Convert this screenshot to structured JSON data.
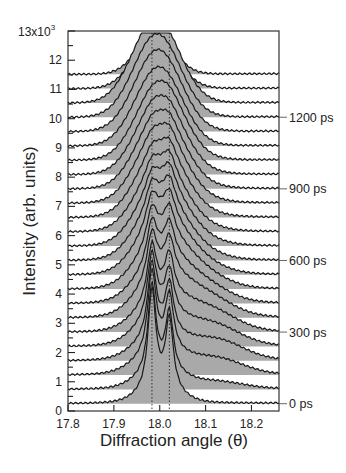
{
  "chart_data": {
    "type": "line",
    "subtype": "waterfall-stacked-diffraction-profiles",
    "title": "",
    "xlabel": "Diffraction angle (θ)",
    "ylabel": "Intensity (arb. units)",
    "xlim": [
      17.8,
      18.26
    ],
    "ylim": [
      0,
      13
    ],
    "y_scale_label": "13x10",
    "y_scale_exponent": "3",
    "x_ticks": [
      "17.8",
      "17.9",
      "18.0",
      "18.1",
      "18.2"
    ],
    "x_tick_values": [
      17.8,
      17.9,
      18.0,
      18.1,
      18.2
    ],
    "y_ticks": [
      "0",
      "1",
      "2",
      "3",
      "4",
      "5",
      "6",
      "7",
      "8",
      "9",
      "10",
      "11",
      "12"
    ],
    "y_tick_values": [
      0,
      1,
      2,
      3,
      4,
      5,
      6,
      7,
      8,
      9,
      10,
      11,
      12
    ],
    "grid": false,
    "reference_lines": [
      {
        "x": 17.983,
        "style": "dotted"
      },
      {
        "x": 18.021,
        "style": "dotted"
      }
    ],
    "fill_color": "#a9a9a9",
    "line_color": "#1a1a1a",
    "time_labels": [
      {
        "label": "0 ps",
        "curve_index": 0
      },
      {
        "label": "300 ps",
        "curve_index": 5
      },
      {
        "label": "600 ps",
        "curve_index": 10
      },
      {
        "label": "900 ps",
        "curve_index": 15
      },
      {
        "label": "1200 ps",
        "curve_index": 20
      }
    ],
    "time_step_ps": 60,
    "curve_count": 22,
    "curve_offset_step": 0.49,
    "first_baseline": 0.25,
    "series_description": "Stacked diffraction profiles from 0 ps (bottom) to ~1260 ps (top), each offset by ~0.49x10^3. Early times show split peaks at 17.983 and 18.021 with a broad shoulder extending toward 18.1–18.2; at later times the profile merges into a single broad peak near 18.00.",
    "series": [
      {
        "time_ps": 0,
        "baseline": 0.25,
        "peak1": {
          "x": 17.983,
          "h": 3.4,
          "w": 0.01
        },
        "peak2": {
          "x": 18.021,
          "h": 2.4,
          "w": 0.01
        },
        "broad": {
          "x": 18.0,
          "h": 0.5,
          "w": 0.04
        },
        "shoulder": {
          "x": 18.12,
          "h": 0.0,
          "w": 0.05
        }
      },
      {
        "time_ps": 60,
        "baseline": 0.74,
        "peak1": {
          "x": 17.983,
          "h": 3.0,
          "w": 0.01
        },
        "peak2": {
          "x": 18.021,
          "h": 2.0,
          "w": 0.01
        },
        "broad": {
          "x": 18.0,
          "h": 0.6,
          "w": 0.045
        },
        "shoulder": {
          "x": 18.12,
          "h": 0.25,
          "w": 0.06
        }
      },
      {
        "time_ps": 120,
        "baseline": 1.23,
        "peak1": {
          "x": 17.983,
          "h": 2.8,
          "w": 0.011
        },
        "peak2": {
          "x": 18.021,
          "h": 1.9,
          "w": 0.011
        },
        "broad": {
          "x": 18.0,
          "h": 0.7,
          "w": 0.05
        },
        "shoulder": {
          "x": 18.12,
          "h": 0.55,
          "w": 0.06
        }
      },
      {
        "time_ps": 180,
        "baseline": 1.72,
        "peak1": {
          "x": 17.983,
          "h": 2.5,
          "w": 0.011
        },
        "peak2": {
          "x": 18.021,
          "h": 1.7,
          "w": 0.011
        },
        "broad": {
          "x": 18.0,
          "h": 0.8,
          "w": 0.05
        },
        "shoulder": {
          "x": 18.12,
          "h": 0.7,
          "w": 0.06
        }
      },
      {
        "time_ps": 240,
        "baseline": 2.21,
        "peak1": {
          "x": 17.983,
          "h": 2.2,
          "w": 0.012
        },
        "peak2": {
          "x": 18.021,
          "h": 1.5,
          "w": 0.012
        },
        "broad": {
          "x": 18.0,
          "h": 0.9,
          "w": 0.05
        },
        "shoulder": {
          "x": 18.11,
          "h": 0.75,
          "w": 0.06
        }
      },
      {
        "time_ps": 300,
        "baseline": 2.7,
        "peak1": {
          "x": 17.983,
          "h": 1.9,
          "w": 0.012
        },
        "peak2": {
          "x": 18.021,
          "h": 1.4,
          "w": 0.012
        },
        "broad": {
          "x": 18.0,
          "h": 1.0,
          "w": 0.05
        },
        "shoulder": {
          "x": 18.1,
          "h": 0.8,
          "w": 0.06
        }
      },
      {
        "time_ps": 360,
        "baseline": 3.19,
        "peak1": {
          "x": 17.983,
          "h": 1.6,
          "w": 0.013
        },
        "peak2": {
          "x": 18.021,
          "h": 1.2,
          "w": 0.013
        },
        "broad": {
          "x": 18.0,
          "h": 1.2,
          "w": 0.05
        },
        "shoulder": {
          "x": 18.09,
          "h": 0.8,
          "w": 0.06
        }
      },
      {
        "time_ps": 420,
        "baseline": 3.68,
        "peak1": {
          "x": 17.983,
          "h": 1.4,
          "w": 0.013
        },
        "peak2": {
          "x": 18.021,
          "h": 1.1,
          "w": 0.013
        },
        "broad": {
          "x": 18.0,
          "h": 1.3,
          "w": 0.05
        },
        "shoulder": {
          "x": 18.08,
          "h": 0.75,
          "w": 0.06
        }
      },
      {
        "time_ps": 480,
        "baseline": 4.17,
        "peak1": {
          "x": 17.983,
          "h": 1.2,
          "w": 0.014
        },
        "peak2": {
          "x": 18.021,
          "h": 1.0,
          "w": 0.014
        },
        "broad": {
          "x": 18.0,
          "h": 1.4,
          "w": 0.05
        },
        "shoulder": {
          "x": 18.07,
          "h": 0.7,
          "w": 0.06
        }
      },
      {
        "time_ps": 540,
        "baseline": 4.66,
        "peak1": {
          "x": 17.983,
          "h": 1.0,
          "w": 0.015
        },
        "peak2": {
          "x": 18.021,
          "h": 0.9,
          "w": 0.015
        },
        "broad": {
          "x": 18.0,
          "h": 1.55,
          "w": 0.05
        },
        "shoulder": {
          "x": 18.06,
          "h": 0.6,
          "w": 0.06
        }
      },
      {
        "time_ps": 600,
        "baseline": 5.15,
        "peak1": {
          "x": 17.983,
          "h": 0.8,
          "w": 0.015
        },
        "peak2": {
          "x": 18.021,
          "h": 0.8,
          "w": 0.015
        },
        "broad": {
          "x": 18.0,
          "h": 1.7,
          "w": 0.05
        },
        "shoulder": {
          "x": 18.05,
          "h": 0.5,
          "w": 0.06
        }
      },
      {
        "time_ps": 660,
        "baseline": 5.64,
        "peak1": {
          "x": 17.983,
          "h": 0.6,
          "w": 0.016
        },
        "peak2": {
          "x": 18.021,
          "h": 0.7,
          "w": 0.016
        },
        "broad": {
          "x": 18.0,
          "h": 1.85,
          "w": 0.05
        },
        "shoulder": {
          "x": 18.05,
          "h": 0.4,
          "w": 0.06
        }
      },
      {
        "time_ps": 720,
        "baseline": 6.13,
        "peak1": {
          "x": 17.983,
          "h": 0.45,
          "w": 0.016
        },
        "peak2": {
          "x": 18.021,
          "h": 0.6,
          "w": 0.016
        },
        "broad": {
          "x": 18.0,
          "h": 2.0,
          "w": 0.05
        },
        "shoulder": {
          "x": 18.05,
          "h": 0.3,
          "w": 0.06
        }
      },
      {
        "time_ps": 780,
        "baseline": 6.62,
        "peak1": {
          "x": 17.983,
          "h": 0.3,
          "w": 0.017
        },
        "peak2": {
          "x": 18.021,
          "h": 0.45,
          "w": 0.017
        },
        "broad": {
          "x": 18.0,
          "h": 2.15,
          "w": 0.05
        },
        "shoulder": {
          "x": 18.05,
          "h": 0.25,
          "w": 0.06
        }
      },
      {
        "time_ps": 840,
        "baseline": 7.11,
        "peak1": {
          "x": 17.983,
          "h": 0.2,
          "w": 0.018
        },
        "peak2": {
          "x": 18.021,
          "h": 0.35,
          "w": 0.018
        },
        "broad": {
          "x": 18.0,
          "h": 2.3,
          "w": 0.05
        },
        "shoulder": {
          "x": 18.05,
          "h": 0.2,
          "w": 0.06
        }
      },
      {
        "time_ps": 900,
        "baseline": 7.6,
        "peak1": {
          "x": 17.983,
          "h": 0.15,
          "w": 0.018
        },
        "peak2": {
          "x": 18.021,
          "h": 0.25,
          "w": 0.018
        },
        "broad": {
          "x": 18.0,
          "h": 2.4,
          "w": 0.05
        },
        "shoulder": {
          "x": 18.05,
          "h": 0.15,
          "w": 0.06
        }
      },
      {
        "time_ps": 960,
        "baseline": 8.09,
        "peak1": {
          "x": 17.983,
          "h": 0.1,
          "w": 0.02
        },
        "peak2": {
          "x": 18.021,
          "h": 0.15,
          "w": 0.02
        },
        "broad": {
          "x": 18.0,
          "h": 2.5,
          "w": 0.05
        },
        "shoulder": {
          "x": 18.05,
          "h": 0.1,
          "w": 0.06
        }
      },
      {
        "time_ps": 1020,
        "baseline": 8.58,
        "peak1": {
          "x": 17.983,
          "h": 0.05,
          "w": 0.02
        },
        "peak2": {
          "x": 18.021,
          "h": 0.1,
          "w": 0.02
        },
        "broad": {
          "x": 18.0,
          "h": 2.6,
          "w": 0.05
        },
        "shoulder": {
          "x": 18.05,
          "h": 0.05,
          "w": 0.06
        }
      },
      {
        "time_ps": 1080,
        "baseline": 9.07,
        "peak1": {
          "x": 17.983,
          "h": 0.0,
          "w": 0.02
        },
        "peak2": {
          "x": 18.021,
          "h": 0.0,
          "w": 0.02
        },
        "broad": {
          "x": 17.998,
          "h": 2.7,
          "w": 0.05
        },
        "shoulder": {
          "x": 18.05,
          "h": 0.0,
          "w": 0.06
        }
      },
      {
        "time_ps": 1140,
        "baseline": 9.56,
        "peak1": {
          "x": 17.983,
          "h": 0.0,
          "w": 0.02
        },
        "peak2": {
          "x": 18.021,
          "h": 0.0,
          "w": 0.02
        },
        "broad": {
          "x": 17.996,
          "h": 2.8,
          "w": 0.05
        },
        "shoulder": {
          "x": 18.05,
          "h": 0.0,
          "w": 0.06
        }
      },
      {
        "time_ps": 1200,
        "baseline": 10.05,
        "peak1": {
          "x": 17.983,
          "h": 0.0,
          "w": 0.02
        },
        "peak2": {
          "x": 18.021,
          "h": 0.0,
          "w": 0.02
        },
        "broad": {
          "x": 17.994,
          "h": 2.85,
          "w": 0.05
        },
        "shoulder": {
          "x": 18.05,
          "h": 0.0,
          "w": 0.06
        }
      },
      {
        "time_ps": 1260,
        "baseline": 10.54,
        "peak1": {
          "x": 17.983,
          "h": 0.0,
          "w": 0.02
        },
        "peak2": {
          "x": 18.021,
          "h": 0.0,
          "w": 0.02
        },
        "broad": {
          "x": 17.992,
          "h": 2.9,
          "w": 0.05
        },
        "shoulder": {
          "x": 18.05,
          "h": 0.0,
          "w": 0.06
        }
      },
      {
        "time_ps": 1320,
        "baseline": 11.03,
        "peak1": {
          "x": 17.983,
          "h": 0.0,
          "w": 0.02
        },
        "peak2": {
          "x": 18.021,
          "h": 0.0,
          "w": 0.02
        },
        "broad": {
          "x": 17.99,
          "h": 1.85,
          "w": 0.045
        },
        "shoulder": {
          "x": 18.05,
          "h": 0.0,
          "w": 0.06
        }
      },
      {
        "time_ps": 1380,
        "baseline": 11.52,
        "peak1": {
          "x": 17.983,
          "h": 0.0,
          "w": 0.02
        },
        "peak2": {
          "x": 18.021,
          "h": 0.0,
          "w": 0.02
        },
        "broad": {
          "x": 17.99,
          "h": 1.35,
          "w": 0.04
        },
        "shoulder": {
          "x": 18.05,
          "h": 0.0,
          "w": 0.06
        }
      }
    ]
  },
  "layout": {
    "plot": {
      "left": 68,
      "right": 279,
      "top": 31,
      "bottom": 411
    },
    "x_px_per_unit": 466
  }
}
